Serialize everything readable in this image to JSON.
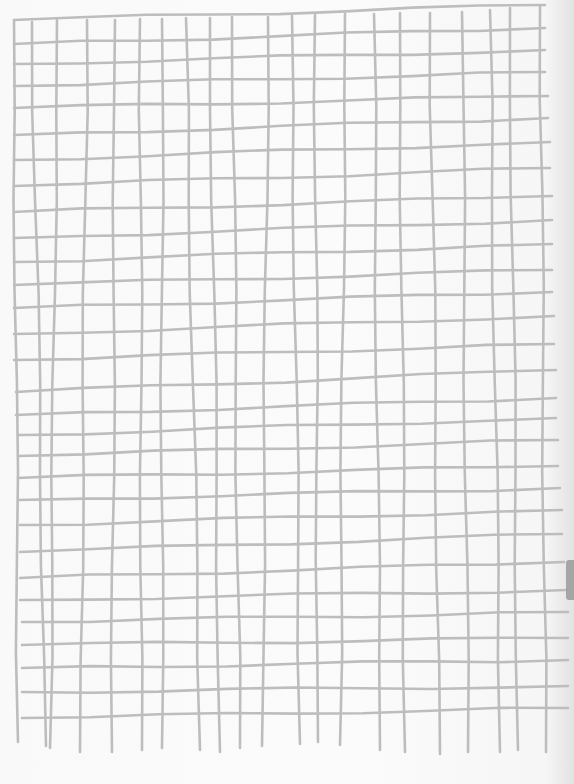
{
  "image": {
    "description": "Hand-drawn grid on white paper, scanned",
    "width": 574,
    "height": 784,
    "colors": {
      "paper": "#f9f9f9",
      "ink": "#bdbdbd",
      "edge_shadow": "#8a8a8a"
    }
  },
  "grid": {
    "vertical_lines": [
      [
        14,
        20,
        18,
        742
      ],
      [
        32,
        22,
        46,
        746
      ],
      [
        57,
        20,
        50,
        748
      ],
      [
        87,
        20,
        80,
        752
      ],
      [
        115,
        20,
        112,
        752
      ],
      [
        140,
        19,
        142,
        750
      ],
      [
        162,
        19,
        162,
        748
      ],
      [
        186,
        18,
        200,
        750
      ],
      [
        210,
        18,
        220,
        752
      ],
      [
        232,
        17,
        240,
        748
      ],
      [
        268,
        17,
        262,
        746
      ],
      [
        292,
        16,
        300,
        744
      ],
      [
        315,
        15,
        318,
        742
      ],
      [
        345,
        14,
        340,
        745
      ],
      [
        374,
        14,
        380,
        750
      ],
      [
        400,
        13,
        405,
        752
      ],
      [
        430,
        13,
        440,
        754
      ],
      [
        462,
        12,
        468,
        752
      ],
      [
        490,
        10,
        500,
        752
      ],
      [
        510,
        8,
        518,
        750
      ],
      [
        540,
        6,
        546,
        752
      ]
    ],
    "horizontal_lines": [
      [
        14,
        20,
        545,
        5
      ],
      [
        14,
        44,
        545,
        28
      ],
      [
        14,
        64,
        545,
        50
      ],
      [
        14,
        86,
        545,
        72
      ],
      [
        14,
        108,
        548,
        96
      ],
      [
        14,
        135,
        548,
        118
      ],
      [
        14,
        160,
        550,
        142
      ],
      [
        14,
        186,
        550,
        168
      ],
      [
        14,
        212,
        552,
        196
      ],
      [
        14,
        238,
        552,
        220
      ],
      [
        14,
        262,
        552,
        244
      ],
      [
        14,
        285,
        552,
        270
      ],
      [
        14,
        308,
        552,
        292
      ],
      [
        14,
        334,
        554,
        316
      ],
      [
        14,
        360,
        554,
        344
      ],
      [
        16,
        392,
        556,
        370
      ],
      [
        16,
        415,
        556,
        398
      ],
      [
        18,
        435,
        556,
        418
      ],
      [
        18,
        456,
        558,
        440
      ],
      [
        18,
        478,
        558,
        466
      ],
      [
        18,
        500,
        560,
        488
      ],
      [
        20,
        525,
        562,
        510
      ],
      [
        20,
        552,
        562,
        534
      ],
      [
        20,
        578,
        564,
        562
      ],
      [
        20,
        600,
        566,
        590
      ],
      [
        22,
        622,
        568,
        612
      ],
      [
        22,
        645,
        568,
        638
      ],
      [
        22,
        668,
        568,
        660
      ],
      [
        22,
        692,
        568,
        686
      ],
      [
        22,
        718,
        568,
        708
      ]
    ]
  }
}
